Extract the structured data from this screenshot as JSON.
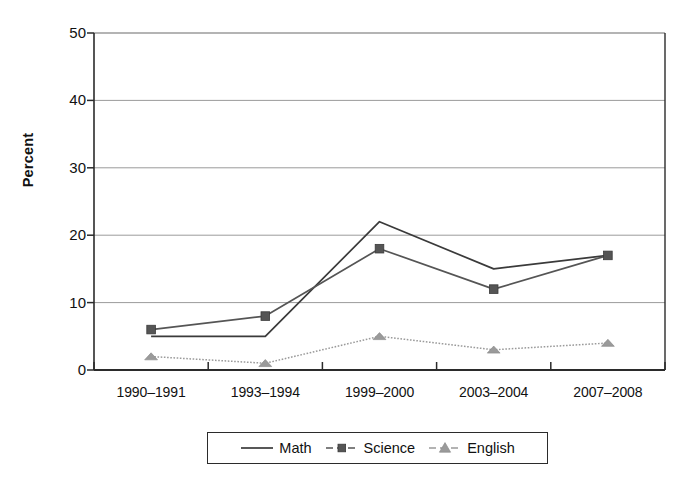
{
  "chart_data": {
    "type": "line",
    "title": "",
    "subtitle": "",
    "xlabel": "",
    "ylabel": "Percent",
    "categories": [
      "1990–1991",
      "1993–1994",
      "1999–2000",
      "2003–2004",
      "2007–2008"
    ],
    "ylim": [
      0,
      50
    ],
    "yticks": [
      0,
      10,
      20,
      30,
      40,
      50
    ],
    "ytick_labels": [
      "0",
      "10",
      "20",
      "30",
      "40",
      "50"
    ],
    "grid": "horizontal",
    "legend_position": "bottom-center",
    "series": [
      {
        "name": "Math",
        "values": [
          5,
          5,
          22,
          15,
          17
        ],
        "marker": "none",
        "line_style": "solid",
        "color": "#3a3a3a"
      },
      {
        "name": "Science",
        "values": [
          6,
          8,
          18,
          12,
          17
        ],
        "marker": "square",
        "line_style": "solid",
        "color": "#555555"
      },
      {
        "name": "English",
        "values": [
          2,
          1,
          5,
          3,
          4
        ],
        "marker": "triangle",
        "line_style": "dotted",
        "color": "#9a9a9a"
      }
    ]
  },
  "legend": {
    "entries": [
      {
        "label": "Math",
        "marker": "line-plain-swatch"
      },
      {
        "label": "Science",
        "marker": "line-square-swatch"
      },
      {
        "label": "English",
        "marker": "line-triangle-swatch"
      }
    ]
  },
  "colors": {
    "axis": "#2b2b2b",
    "grid": "#9b9b9b",
    "math": "#3a3a3a",
    "science": "#555555",
    "english": "#9a9a9a",
    "background": "#ffffff"
  }
}
